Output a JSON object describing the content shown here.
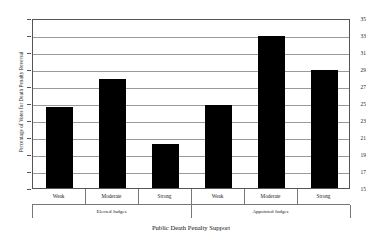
{
  "chart_data": {
    "type": "bar",
    "title": "",
    "xlabel": "Public Death Penalty Support",
    "ylabel": "Percentage of Votes for Death Penalty Reversal",
    "categories": [
      "Weak",
      "Moderate",
      "Strong",
      "Weak",
      "Moderate",
      "Strong"
    ],
    "values": [
      24.5,
      27.8,
      20.2,
      24.8,
      32.9,
      28.9
    ],
    "groups": [
      {
        "label": "Elected Judges",
        "categories": [
          "Weak",
          "Moderate",
          "Strong"
        ],
        "values": [
          24.5,
          27.8,
          20.2
        ]
      },
      {
        "label": "Appointed Judges",
        "categories": [
          "Weak",
          "Moderate",
          "Strong"
        ],
        "values": [
          24.8,
          32.9,
          28.9
        ]
      }
    ],
    "ylim": [
      15,
      35
    ],
    "yticks": [
      15,
      17,
      19,
      21,
      23,
      25,
      27,
      29,
      31,
      33,
      35
    ],
    "ytick_labels": [
      "15",
      "17",
      "19",
      "21",
      "23",
      "25",
      "27",
      "29",
      "31",
      "33",
      "35"
    ],
    "grid": true,
    "grid_axis": "y",
    "legend": "none",
    "bar_color": "#000000",
    "background_color": "#ffffff",
    "gridline_color": "#9a9a9a",
    "axis_color": "#555555"
  }
}
